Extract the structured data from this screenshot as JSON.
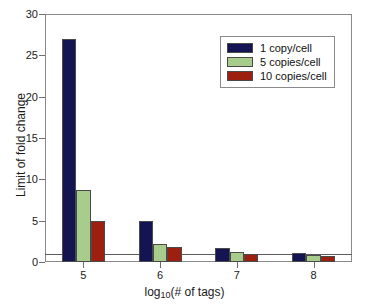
{
  "chart_data": {
    "type": "bar",
    "title": "",
    "xlabel": "log10(# of tags)",
    "xlabel_base": "log",
    "xlabel_sub": "10",
    "xlabel_rest": "(# of tags)",
    "ylabel": "Limit of fold change",
    "categories": [
      "5",
      "6",
      "7",
      "8"
    ],
    "xtick_labels": [
      "5",
      "6",
      "7",
      "8"
    ],
    "ytick_labels": [
      "0",
      "5",
      "10",
      "15",
      "20",
      "25",
      "30"
    ],
    "ylim": [
      0,
      30
    ],
    "ytick_step": 5,
    "grid": false,
    "legend_position": "upper right",
    "reference_line": {
      "value": 1,
      "orientation": "horizontal",
      "color": "#5a5a5a"
    },
    "series": [
      {
        "name": "1 copy/cell",
        "color": "#141452",
        "values": [
          27.0,
          4.9,
          1.7,
          1.05
        ]
      },
      {
        "name": "5 copies/cell",
        "color": "#a8cc8c",
        "values": [
          8.7,
          2.2,
          1.2,
          0.85
        ]
      },
      {
        "name": "10 copies/cell",
        "color": "#9c1f10",
        "values": [
          5.0,
          1.8,
          1.0,
          0.75
        ]
      }
    ]
  },
  "legend": {
    "items": [
      {
        "label": "1 copy/cell",
        "color": "#141452"
      },
      {
        "label": "5 copies/cell",
        "color": "#a8cc8c"
      },
      {
        "label": "10 copies/cell",
        "color": "#9c1f10"
      }
    ]
  },
  "colors": {
    "series_1": "#141452",
    "series_2": "#a8cc8c",
    "series_3": "#9c1f10",
    "axis": "#8a8a8a",
    "reference_line": "#5a5a5a",
    "background": "#ffffff",
    "text": "#1a1a1a"
  }
}
